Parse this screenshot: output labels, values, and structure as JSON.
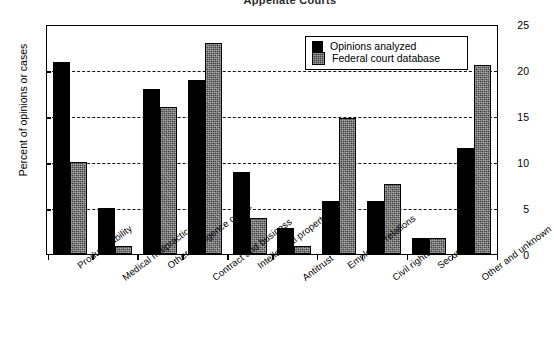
{
  "chart_data": {
    "type": "bar",
    "title": "Appellate Courts",
    "xlabel": "",
    "ylabel": "Percent of opinions or cases",
    "ylim": [
      0,
      25
    ],
    "yticks": [
      0,
      5,
      10,
      15,
      20,
      25
    ],
    "grid": true,
    "gridlines_at": [
      5,
      10,
      15,
      20
    ],
    "legend_position": "upper right",
    "categories": [
      "Product liability",
      "Medical malpractice",
      "Other negligence or tort",
      "Contract and business",
      "Intellectual property",
      "Antitrust",
      "Employee relations",
      "Civil rights",
      "Securities",
      "Other and unknown"
    ],
    "series": [
      {
        "name": "Opinions analyzed",
        "fill": "solid-black",
        "color": "#000000",
        "values": [
          21.0,
          5.0,
          18.0,
          19.0,
          8.9,
          2.8,
          5.8,
          5.8,
          1.7,
          11.6
        ]
      },
      {
        "name": "Federal court database",
        "fill": "dark-textured",
        "color": "#3f3f3f",
        "values": [
          10.0,
          0.9,
          16.0,
          23.0,
          3.9,
          0.9,
          14.9,
          7.6,
          1.7,
          20.6
        ]
      }
    ]
  },
  "legend": {
    "entries": [
      {
        "label": "Opinions analyzed",
        "swatch": "solid-black-swatch"
      },
      {
        "label": "Federal court database",
        "swatch": "textured-swatch"
      }
    ]
  },
  "axes": {
    "y_tick_labels": [
      "25",
      "20",
      "15",
      "10",
      "5",
      "0"
    ]
  }
}
